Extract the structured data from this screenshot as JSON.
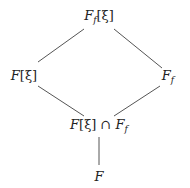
{
  "diagram": {
    "type": "field-lattice",
    "nodes": [
      {
        "id": "top",
        "base": "F",
        "sub": "f",
        "bracket": "[ξ]",
        "suffix": "",
        "x": 99,
        "y": 17
      },
      {
        "id": "left",
        "base": "F",
        "sub": "",
        "bracket": "[ξ]",
        "suffix": "",
        "x": 24,
        "y": 75
      },
      {
        "id": "right",
        "base": "F",
        "sub": "f",
        "bracket": "",
        "suffix": "",
        "x": 168,
        "y": 77
      },
      {
        "id": "meet",
        "base": "F",
        "sub": "",
        "bracket": "[ξ]",
        "suffix": "∩",
        "x": 99,
        "y": 126
      },
      {
        "id": "bottom",
        "base": "F",
        "sub": "",
        "bracket": "",
        "suffix": "",
        "x": 99,
        "y": 176
      }
    ],
    "labels": {
      "top": {
        "main": "F",
        "sub": "f",
        "tail": "[ξ]"
      },
      "left": {
        "main": "F",
        "tail": "[ξ]"
      },
      "right": {
        "main": "F",
        "sub": "f"
      },
      "meet": {
        "main": "F",
        "tail": "[ξ] ∩ ",
        "main2": "F",
        "sub2": "f"
      },
      "bottom": {
        "main": "F"
      }
    },
    "edges": [
      {
        "from": "top",
        "to": "left"
      },
      {
        "from": "top",
        "to": "right"
      },
      {
        "from": "left",
        "to": "meet"
      },
      {
        "from": "right",
        "to": "meet"
      },
      {
        "from": "meet",
        "to": "bottom"
      }
    ]
  }
}
